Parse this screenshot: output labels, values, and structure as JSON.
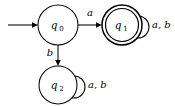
{
  "diagram": {
    "type": "finite-state-automaton",
    "title": "",
    "background_color": "#ffffff",
    "stroke_color": "#000000",
    "alphabet": [
      "a",
      "b"
    ],
    "states": [
      {
        "id": "q0",
        "label_base": "q",
        "label_sub": "0",
        "label_full": "q0",
        "accepting": false,
        "start": true,
        "cx": 58,
        "cy": 25,
        "r": 20
      },
      {
        "id": "q1",
        "label_base": "q",
        "label_sub": "1",
        "label_full": "q1",
        "accepting": true,
        "start": false,
        "cx": 122,
        "cy": 25,
        "r": 20,
        "r_inner": 16.5
      },
      {
        "id": "q2",
        "label_base": "q",
        "label_sub": "2",
        "label_full": "q2",
        "accepting": false,
        "start": false,
        "cx": 58,
        "cy": 85,
        "r": 19
      }
    ],
    "start_arrow": {
      "label": "",
      "from_x": 8,
      "to_x": 38,
      "y": 25
    },
    "transitions": [
      {
        "from": "q0",
        "to": "q1",
        "label": "a",
        "kind": "straight",
        "label_x": 90,
        "label_y": 16
      },
      {
        "from": "q0",
        "to": "q2",
        "label": "b",
        "kind": "straight",
        "label_x": 50,
        "label_y": 56
      },
      {
        "from": "q1",
        "to": "q1",
        "label": "a, b",
        "kind": "self-loop",
        "label_x": 147,
        "label_y": 28
      },
      {
        "from": "q2",
        "to": "q2",
        "label": "a, b",
        "kind": "self-loop",
        "label_x": 84,
        "label_y": 88
      }
    ]
  }
}
